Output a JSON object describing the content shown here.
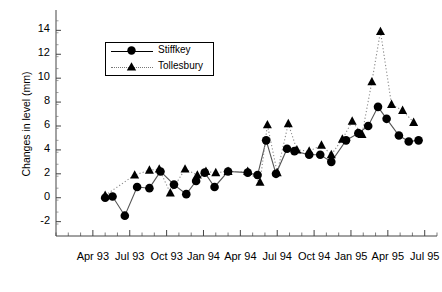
{
  "chart_data": {
    "type": "line",
    "title": "",
    "xlabel": "",
    "ylabel": "Changes in level (mm)",
    "ylim": [
      -3.2,
      15.2
    ],
    "yticks": [
      -2,
      0,
      2,
      4,
      6,
      8,
      10,
      12,
      14
    ],
    "xticklabels": [
      "Apr 93",
      "Jul 93",
      "Oct 93",
      "Jan 94",
      "Apr 94",
      "Jul 94",
      "Oct 94",
      "Jan 95",
      "Apr 95",
      "Jul 95"
    ],
    "xtick_months": [
      3,
      6,
      9,
      12,
      15,
      18,
      21,
      24,
      27,
      30
    ],
    "x_minor_ticks": "monthly",
    "grid": false,
    "legend_position": "top-left-inset",
    "xrange_months": [
      0,
      31
    ],
    "series": [
      {
        "name": "Stiffkey",
        "marker": "circle",
        "linestyle": "solid",
        "color": "#000000",
        "points": [
          {
            "m": 4.0,
            "v": 0.0
          },
          {
            "m": 4.6,
            "v": 0.1
          },
          {
            "m": 5.6,
            "v": -1.5
          },
          {
            "m": 6.6,
            "v": 0.9
          },
          {
            "m": 7.6,
            "v": 0.8
          },
          {
            "m": 8.5,
            "v": 2.2
          },
          {
            "m": 9.6,
            "v": 1.1
          },
          {
            "m": 10.6,
            "v": 0.3
          },
          {
            "m": 11.4,
            "v": 1.4
          },
          {
            "m": 12.1,
            "v": 2.1
          },
          {
            "m": 12.9,
            "v": 0.9
          },
          {
            "m": 14.0,
            "v": 2.2
          },
          {
            "m": 15.6,
            "v": 2.1
          },
          {
            "m": 16.4,
            "v": 1.9
          },
          {
            "m": 17.1,
            "v": 4.8
          },
          {
            "m": 17.9,
            "v": 2.0
          },
          {
            "m": 18.8,
            "v": 4.1
          },
          {
            "m": 19.4,
            "v": 3.9
          },
          {
            "m": 20.6,
            "v": 3.6
          },
          {
            "m": 21.5,
            "v": 3.6
          },
          {
            "m": 22.4,
            "v": 3.0
          },
          {
            "m": 23.6,
            "v": 4.8
          },
          {
            "m": 24.6,
            "v": 5.4
          },
          {
            "m": 25.4,
            "v": 6.0
          },
          {
            "m": 26.2,
            "v": 7.6
          },
          {
            "m": 26.9,
            "v": 6.6
          },
          {
            "m": 27.9,
            "v": 5.2
          },
          {
            "m": 28.7,
            "v": 4.7
          },
          {
            "m": 29.5,
            "v": 4.8
          }
        ]
      },
      {
        "name": "Tollesbury",
        "marker": "triangle",
        "linestyle": "dotted",
        "color": "#000000",
        "points": [
          {
            "m": 4.0,
            "v": 0.2
          },
          {
            "m": 6.4,
            "v": 1.9
          },
          {
            "m": 7.6,
            "v": 2.3
          },
          {
            "m": 8.4,
            "v": 2.4
          },
          {
            "m": 9.3,
            "v": 0.4
          },
          {
            "m": 10.5,
            "v": 2.4
          },
          {
            "m": 11.5,
            "v": 1.9
          },
          {
            "m": 12.2,
            "v": 2.2
          },
          {
            "m": 13.0,
            "v": 2.1
          },
          {
            "m": 14.0,
            "v": 2.2
          },
          {
            "m": 15.6,
            "v": 2.2
          },
          {
            "m": 16.6,
            "v": 1.3
          },
          {
            "m": 17.2,
            "v": 6.1
          },
          {
            "m": 18.0,
            "v": 2.1
          },
          {
            "m": 18.9,
            "v": 6.2
          },
          {
            "m": 19.6,
            "v": 4.0
          },
          {
            "m": 20.6,
            "v": 3.9
          },
          {
            "m": 21.6,
            "v": 4.4
          },
          {
            "m": 22.4,
            "v": 3.6
          },
          {
            "m": 23.3,
            "v": 4.9
          },
          {
            "m": 24.1,
            "v": 6.4
          },
          {
            "m": 24.9,
            "v": 5.3
          },
          {
            "m": 25.7,
            "v": 9.7
          },
          {
            "m": 26.4,
            "v": 13.9
          },
          {
            "m": 27.3,
            "v": 7.8
          },
          {
            "m": 28.2,
            "v": 7.3
          },
          {
            "m": 29.1,
            "v": 6.3
          }
        ]
      }
    ]
  },
  "legend": {
    "items": [
      {
        "label": "Stiffkey",
        "marker": "circle",
        "line": "solid"
      },
      {
        "label": "Tollesbury",
        "marker": "triangle",
        "line": "dotted"
      }
    ]
  }
}
